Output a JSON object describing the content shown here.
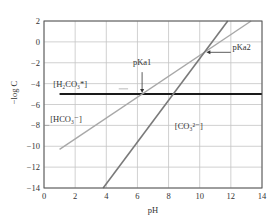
{
  "chart_data": {
    "type": "line",
    "title": "",
    "xlabel": "pH",
    "ylabel": "−log C",
    "xlim": [
      0,
      14
    ],
    "ylim": [
      -14,
      2
    ],
    "x_ticks": [
      0,
      2,
      4,
      6,
      8,
      10,
      12,
      14
    ],
    "y_ticks": [
      2,
      0,
      -2,
      -4,
      -6,
      -8,
      -10,
      -12,
      -14
    ],
    "grid": true,
    "legend": "inline labels",
    "series": [
      {
        "name": "[H2CO3*]",
        "label": "[H₂CO₃*]",
        "color": "#1a1a1a",
        "width": 2.0,
        "x": [
          1,
          14
        ],
        "y": [
          -5,
          -5
        ]
      },
      {
        "name": "[HCO3−]",
        "label": "[HCO₃⁻]",
        "color": "#a8a8a8",
        "width": 1.4,
        "x": [
          1,
          13.3
        ],
        "y": [
          -10.3,
          2
        ]
      },
      {
        "name": "[CO3 2−]",
        "label": "[CO₃²⁻]",
        "color": "#7a7a7a",
        "width": 1.6,
        "x": [
          3.8,
          11.8
        ],
        "y": [
          -14,
          2
        ]
      }
    ],
    "annotations": [
      {
        "text": "pKa1",
        "arrow_to": {
          "x": 6.3,
          "y": -5
        },
        "text_pos": {
          "x": 6.3,
          "y": -2.2
        }
      },
      {
        "text": "pKa2",
        "arrow_to": {
          "x": 10.3,
          "y": -1
        },
        "text_pos": {
          "x": 12.8,
          "y": -1
        }
      }
    ]
  },
  "labels": {
    "xlabel": "pH",
    "ylabel": "−log C",
    "h2co3": "[H₂CO₃*]",
    "hco3": "[HCO₃⁻]",
    "co3": "[CO₃²⁻]",
    "pka1": "pKa1",
    "pka2": "pKa2"
  }
}
